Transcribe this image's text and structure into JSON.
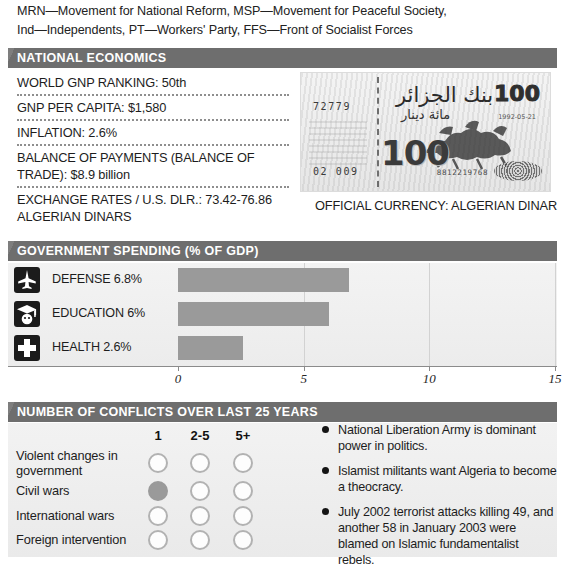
{
  "intro": {
    "line1": "MRN—Movement for National Reform, MSP—Movement for Peaceful Society,",
    "line2": "Ind—Independents, PT—Workers' Party, FFS—Front of Socialist Forces"
  },
  "economics": {
    "header": "NATIONAL ECONOMICS",
    "rows": [
      "WORLD GNP RANKING: 50th",
      "GNP PER CAPITA: $1,580",
      "INFLATION: 2.6%",
      "BALANCE OF PAYMENTS (BALANCE OF TRADE): $8.9 billion",
      "EXCHANGE RATES / U.S. DLR.: 73.42-76.86 ALGERIAN DINARS"
    ],
    "banknote": {
      "serial_top_left": "72779",
      "serial_bottom_left": "02 009",
      "serial_bottom_right": "8812219768",
      "denomination_top": "100",
      "denomination_bottom": "100",
      "arabic_top": "بنك الجزائر",
      "arabic_mid": "مائة دينار",
      "date": "1992-05-21"
    },
    "currency_caption": "OFFICIAL CURRENCY: ALGERIAN DINAR"
  },
  "government_spending": {
    "header": "GOVERNMENT SPENDING (% OF GDP)"
  },
  "conflicts": {
    "header": "NUMBER OF CONFLICTS OVER LAST 25 YEARS",
    "columns": [
      "1",
      "2-5",
      "5+"
    ],
    "rows": [
      {
        "label": "Violent changes in government",
        "marks": [
          false,
          false,
          false
        ]
      },
      {
        "label": "Civil wars",
        "marks": [
          true,
          false,
          false
        ]
      },
      {
        "label": "International wars",
        "marks": [
          false,
          false,
          false
        ]
      },
      {
        "label": "Foreign intervention",
        "marks": [
          false,
          false,
          false
        ]
      }
    ],
    "bullets": [
      "National Liberation Army is dominant power in politics.",
      "Islamist militants want Algeria to become a theocracy.",
      "July 2002 terrorist attacks killing 49, and another 58 in January 2003 were blamed on Islamic fundamentalist rebels."
    ]
  },
  "chart_data": {
    "type": "bar",
    "title": "GOVERNMENT SPENDING (% OF GDP)",
    "orientation": "horizontal",
    "categories": [
      "DEFENSE",
      "EDUCATION",
      "HEALTH"
    ],
    "labels": [
      "DEFENSE 6.8%",
      "EDUCATION 6%",
      "HEALTH 2.6%"
    ],
    "icons": [
      "fighter-jet-icon",
      "graduation-cap-icon",
      "medical-cross-icon"
    ],
    "values": [
      6.8,
      6,
      2.6
    ],
    "xlabel": "",
    "ylabel": "",
    "xlim": [
      0,
      15
    ],
    "ticks": [
      0,
      5,
      10,
      15
    ],
    "ticklabels": [
      "0",
      "5",
      "10",
      "15"
    ],
    "grid": true,
    "bar_color": "#9a9a9a"
  },
  "colors": {
    "band": "#6e6e6e",
    "bar": "#9a9a9a",
    "filled_circle": "#9a9a9a",
    "panel": "#eeeeee"
  }
}
